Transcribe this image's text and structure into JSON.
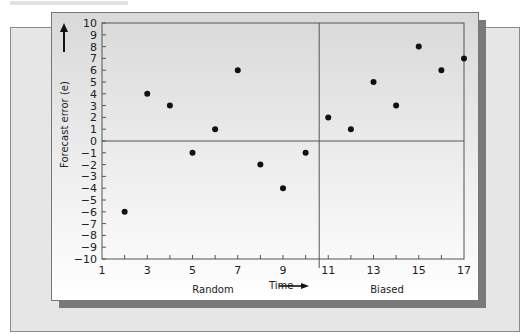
{
  "chart_data": {
    "type": "scatter",
    "title": "",
    "xlabel": "Time",
    "ylabel": "Forecast error (e)",
    "xlim": [
      1,
      17
    ],
    "ylim": [
      -10,
      10
    ],
    "x_ticks": [
      1,
      3,
      5,
      7,
      9,
      11,
      13,
      15,
      17
    ],
    "y_ticks": [
      10,
      9,
      8,
      7,
      6,
      5,
      4,
      3,
      2,
      1,
      0,
      -1,
      -2,
      -3,
      -4,
      -5,
      -6,
      -7,
      -8,
      -9,
      -10
    ],
    "grid": false,
    "divider_x": 10.6,
    "regions": [
      {
        "name": "Random",
        "x_range": [
          1,
          10.6
        ]
      },
      {
        "name": "Biased",
        "x_range": [
          10.6,
          17
        ]
      }
    ],
    "series": [
      {
        "name": "Random",
        "points": [
          [
            2,
            -6
          ],
          [
            3,
            4
          ],
          [
            4,
            3
          ],
          [
            5,
            -1
          ],
          [
            6,
            1
          ],
          [
            7,
            6
          ],
          [
            8,
            -2
          ],
          [
            9,
            -4
          ],
          [
            10,
            -1
          ]
        ]
      },
      {
        "name": "Biased",
        "points": [
          [
            11,
            2
          ],
          [
            12,
            1
          ],
          [
            13,
            5
          ],
          [
            14,
            3
          ],
          [
            15,
            8
          ],
          [
            16,
            6
          ],
          [
            17,
            7
          ]
        ]
      }
    ]
  },
  "labels": {
    "ylabel": "Forecast error (e)",
    "xlabel": "Time",
    "region_left": "Random",
    "region_right": "Biased"
  },
  "colors": {
    "point": "#111111",
    "axis": "#555555"
  }
}
